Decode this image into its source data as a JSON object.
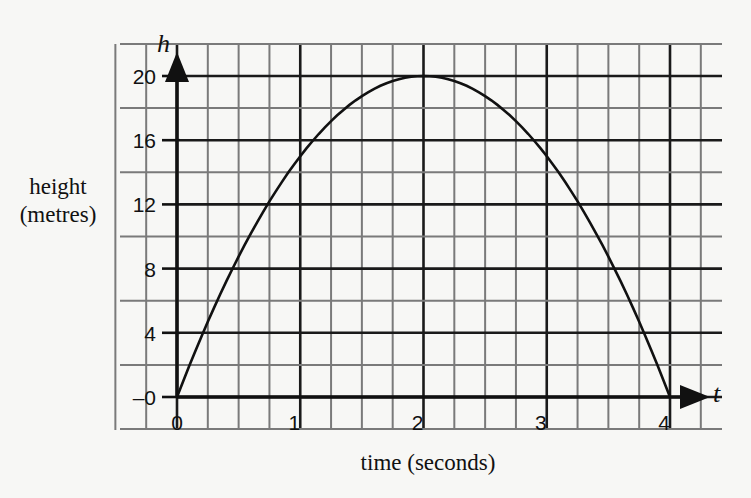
{
  "chart_data": {
    "type": "line",
    "title": "",
    "xlabel": "time (seconds)",
    "ylabel_lines": [
      "height",
      "(metres)"
    ],
    "x_axis_variable": "t",
    "y_axis_variable": "h",
    "xlim": [
      0,
      4
    ],
    "ylim": [
      0,
      20
    ],
    "x_ticks": [
      0,
      1,
      2,
      3,
      4
    ],
    "x_tick_labels": [
      "0",
      "1",
      "2",
      "3",
      "4"
    ],
    "y_ticks": [
      0,
      4,
      8,
      12,
      16,
      20
    ],
    "y_tick_labels": [
      "0",
      "4",
      "8",
      "12",
      "16",
      "20"
    ],
    "grid": true,
    "legend": null,
    "series": [
      {
        "name": "height",
        "equation": "h = 5t(4 - t)",
        "x": [
          0,
          0.25,
          0.5,
          0.75,
          1,
          1.25,
          1.5,
          1.75,
          2,
          2.25,
          2.5,
          2.75,
          3,
          3.25,
          3.5,
          3.75,
          4
        ],
        "y": [
          0,
          4.69,
          8.75,
          12.19,
          15,
          17.19,
          18.75,
          19.69,
          20,
          19.69,
          18.75,
          17.19,
          15,
          12.19,
          8.75,
          4.69,
          0
        ]
      }
    ]
  },
  "colors": {
    "background": "#f7f7f5",
    "major_grid": "#1a1a1a",
    "minor_grid": "#7a7a7a",
    "curve": "#111111"
  }
}
